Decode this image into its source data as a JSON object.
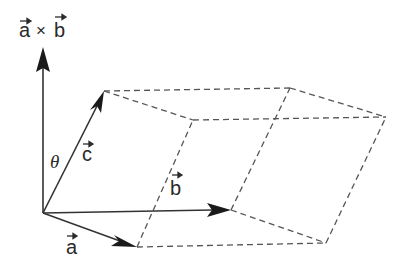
{
  "diagram": {
    "labels": {
      "cross_product": "a × b",
      "cross_a": "a",
      "cross_times": "×",
      "cross_b": "b",
      "vector_a": "a",
      "vector_b": "b",
      "vector_c": "c",
      "angle": "θ"
    },
    "colors": {
      "solid_line": "#333333",
      "dashed_line": "#555555",
      "text": "#2a2a2a",
      "background": "#ffffff"
    },
    "vertices": {
      "origin": [
        43,
        213
      ],
      "a": [
        137,
        247
      ],
      "b": [
        231,
        210
      ],
      "c": [
        104,
        91
      ],
      "a_plus_b": [
        326,
        243
      ],
      "a_plus_c": [
        193,
        120
      ],
      "b_plus_c": [
        290,
        88
      ],
      "a_plus_b_plus_c": [
        386,
        117
      ],
      "cross_tip": [
        43,
        47
      ]
    }
  }
}
